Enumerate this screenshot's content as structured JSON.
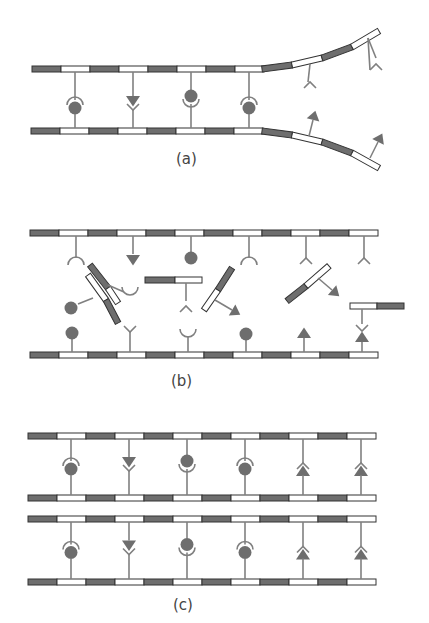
{
  "colors": {
    "dark_segment": "#6e6e6e",
    "light_segment": "#ffffff",
    "outline": "#333333",
    "stalk": "#808080",
    "shape_fill": "#6e6e6e",
    "background": "#ffffff"
  },
  "panels": [
    {
      "id": "a",
      "label": "(a)",
      "description": "Double strand with complementary shapes (circle/cup, triangle/V) pairing; strands separating at right end, exposing unpaired Y-forks on top and arrowheads on bottom",
      "pairs": [
        "cup-circle",
        "triangle-V",
        "circle-cup",
        "cup-circle"
      ]
    },
    {
      "id": "b",
      "label": "(b)",
      "description": "Separated strands with free-floating short segments carrying shapes that align with complementary shapes on each strand",
      "top_strand_shapes": [
        "cup",
        "triangle",
        "circle",
        "cup",
        "fork",
        "fork"
      ],
      "bottom_strand_shapes": [
        "circle",
        "fork",
        "cup",
        "circle",
        "triangle",
        "triangle"
      ]
    },
    {
      "id": "c",
      "label": "(c)",
      "description": "Two identical double strands produced by complementary pairing",
      "pairs": [
        "cup-circle",
        "triangle-V",
        "circle-cup",
        "cup-circle",
        "V-triangle",
        "V-triangle"
      ]
    }
  ]
}
